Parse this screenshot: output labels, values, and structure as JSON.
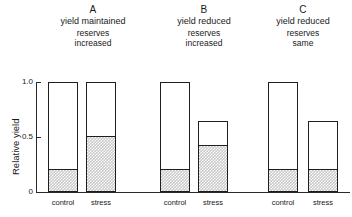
{
  "chart_data": {
    "type": "bar",
    "title": "",
    "subtitle": "",
    "xlabel": "",
    "ylabel": "Relative yield",
    "ylim": [
      0,
      1.0
    ],
    "ytick_labels": [
      "0",
      "0.5",
      "1.0"
    ],
    "ytick_values": [
      0,
      0.5,
      1.0
    ],
    "grid": false,
    "legend": "none",
    "stacked": true,
    "series": [
      {
        "name": "reserves",
        "note": "shaded stippled lower portion of each bar"
      },
      {
        "name": "yield above reserves",
        "note": "white upper portion of each bar"
      }
    ],
    "panels": [
      {
        "letter": "A",
        "yield_caption": "yield maintained",
        "reserves_caption_line1": "reserves",
        "reserves_caption_line2": "increased",
        "categories": [
          "control",
          "stress"
        ],
        "totals": [
          1.0,
          1.0
        ],
        "reserves": [
          0.2,
          0.5
        ]
      },
      {
        "letter": "B",
        "yield_caption": "yield reduced",
        "reserves_caption_line1": "reserves",
        "reserves_caption_line2": "increased",
        "categories": [
          "control",
          "stress"
        ],
        "totals": [
          1.0,
          0.65
        ],
        "reserves": [
          0.2,
          0.42
        ]
      },
      {
        "letter": "C",
        "yield_caption": "yield reduced",
        "reserves_caption_line1": "reserves",
        "reserves_caption_line2": "same",
        "categories": [
          "control",
          "stress"
        ],
        "totals": [
          1.0,
          0.65
        ],
        "reserves": [
          0.2,
          0.2
        ]
      }
    ],
    "colors": {
      "bar_outline": "#1e1e1e",
      "bar_white": "#ffffff",
      "bar_shaded": "#c9c9c9",
      "axis": "#2a2a2a",
      "text": "#1a1a1a",
      "background": "#ffffff"
    }
  }
}
